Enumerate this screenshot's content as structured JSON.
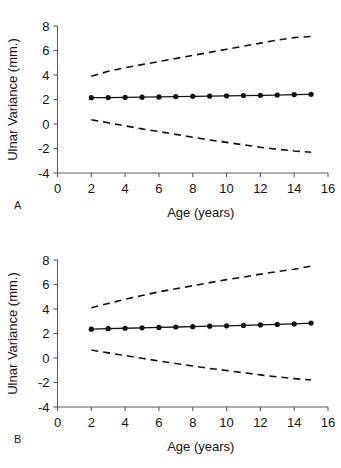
{
  "figure": {
    "panels": [
      {
        "id": "A",
        "letter": "A",
        "chart_index": 0
      },
      {
        "id": "B",
        "letter": "B",
        "chart_index": 1
      }
    ]
  },
  "chart_data": [
    {
      "type": "line",
      "panel": "A",
      "title": "",
      "xlabel": "Age (years)",
      "ylabel": "Ulnar Variance (mm.)",
      "xlim": [
        0,
        16
      ],
      "ylim": [
        -4,
        8
      ],
      "xticks": [
        0,
        2,
        4,
        6,
        8,
        10,
        12,
        14,
        16
      ],
      "xtick_labels": [
        "0",
        "2",
        "4",
        "6",
        "8",
        "10",
        "12",
        "14",
        "16"
      ],
      "yticks": [
        -4,
        -2,
        0,
        2,
        4,
        6,
        8
      ],
      "ytick_labels": [
        "-4",
        "-2",
        "0",
        "2",
        "4",
        "6",
        "8"
      ],
      "grid": false,
      "legend": "none",
      "x": [
        2,
        3,
        4,
        5,
        6,
        7,
        8,
        9,
        10,
        11,
        12,
        13,
        14,
        15
      ],
      "series": [
        {
          "name": "Mean ulnar variance",
          "style": "solid-with-markers",
          "marker": "filled-circle",
          "values": [
            2.15,
            2.16,
            2.18,
            2.19,
            2.21,
            2.24,
            2.26,
            2.28,
            2.3,
            2.32,
            2.34,
            2.36,
            2.4,
            2.42
          ]
        },
        {
          "name": "Upper prediction limit",
          "style": "dashed",
          "marker": "none",
          "values": [
            3.9,
            4.3,
            4.6,
            4.85,
            5.1,
            5.35,
            5.6,
            5.85,
            6.1,
            6.35,
            6.6,
            6.85,
            7.05,
            7.15
          ]
        },
        {
          "name": "Lower prediction limit",
          "style": "dashed",
          "marker": "none",
          "values": [
            0.35,
            0.1,
            -0.15,
            -0.4,
            -0.62,
            -0.85,
            -1.08,
            -1.3,
            -1.5,
            -1.7,
            -1.9,
            -2.06,
            -2.2,
            -2.3
          ]
        }
      ]
    },
    {
      "type": "line",
      "panel": "B",
      "title": "",
      "xlabel": "Age (years)",
      "ylabel": "Ulnar Variance (mm.)",
      "xlim": [
        0,
        16
      ],
      "ylim": [
        -4,
        8
      ],
      "xticks": [
        0,
        2,
        4,
        6,
        8,
        10,
        12,
        14,
        16
      ],
      "xtick_labels": [
        "0",
        "2",
        "4",
        "6",
        "8",
        "10",
        "12",
        "14",
        "16"
      ],
      "yticks": [
        -4,
        -2,
        0,
        2,
        4,
        6,
        8
      ],
      "ytick_labels": [
        "-4",
        "-2",
        "0",
        "2",
        "4",
        "6",
        "8"
      ],
      "grid": false,
      "legend": "none",
      "x": [
        2,
        3,
        4,
        5,
        6,
        7,
        8,
        9,
        10,
        11,
        12,
        13,
        14,
        15
      ],
      "series": [
        {
          "name": "Mean ulnar variance",
          "style": "solid-with-markers",
          "marker": "filled-circle",
          "values": [
            2.35,
            2.39,
            2.43,
            2.46,
            2.5,
            2.53,
            2.56,
            2.6,
            2.63,
            2.66,
            2.7,
            2.74,
            2.78,
            2.85
          ]
        },
        {
          "name": "Upper prediction limit",
          "style": "dashed",
          "marker": "none",
          "values": [
            4.1,
            4.45,
            4.8,
            5.1,
            5.4,
            5.65,
            5.9,
            6.15,
            6.4,
            6.6,
            6.85,
            7.05,
            7.25,
            7.5
          ]
        },
        {
          "name": "Lower prediction limit",
          "style": "dashed",
          "marker": "none",
          "values": [
            0.65,
            0.42,
            0.2,
            -0.02,
            -0.25,
            -0.45,
            -0.65,
            -0.85,
            -1.02,
            -1.2,
            -1.38,
            -1.54,
            -1.68,
            -1.8
          ]
        }
      ]
    }
  ]
}
